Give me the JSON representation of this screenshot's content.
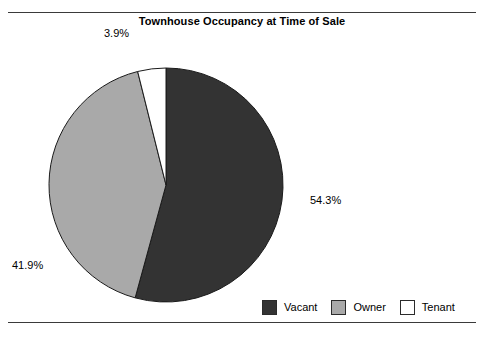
{
  "chart_data": {
    "type": "pie",
    "title": "Townhouse Occupancy at Time of Sale",
    "xlabel": "",
    "ylabel": "",
    "categories": [
      "Vacant",
      "Owner",
      "Tenant"
    ],
    "values": [
      54.3,
      41.9,
      3.9
    ],
    "value_labels": [
      "54.3%",
      "41.9%",
      "3.9%"
    ],
    "colors": [
      "#333333",
      "#a9a9a9",
      "#ffffff"
    ],
    "slice_border_color": "#1a1a1a",
    "start_angle_deg": 0,
    "direction": "clockwise",
    "legend": {
      "position": "bottom-right",
      "entries": [
        {
          "label": "Vacant",
          "color": "#333333"
        },
        {
          "label": "Owner",
          "color": "#a9a9a9"
        },
        {
          "label": "Tenant",
          "color": "#ffffff"
        }
      ]
    },
    "grid": false,
    "labels_outside": true
  },
  "figure": {
    "title": "Townhouse Occupancy at Time of Sale",
    "background": "#ffffff",
    "rule_color": "#3a3a3a"
  },
  "labels": {
    "tenant": "3.9%",
    "vacant": "54.3%",
    "owner": "41.9%"
  },
  "legend": {
    "vacant": "Vacant",
    "owner": "Owner",
    "tenant": "Tenant"
  }
}
